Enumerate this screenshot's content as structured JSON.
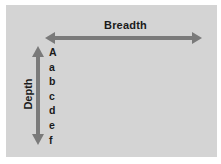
{
  "diagram": {
    "horizontal_label": "Breadth",
    "vertical_label": "Depth",
    "hierarchy_items": [
      "A",
      "a",
      "b",
      "c",
      "d",
      "e",
      "f"
    ],
    "colors": {
      "panel": "#d4d4d4",
      "arrow": "#7a7a7a",
      "text": "#1a1a1a"
    }
  }
}
